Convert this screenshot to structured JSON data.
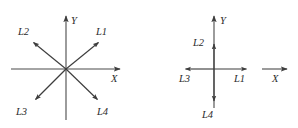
{
  "figure": {
    "title": "",
    "background_color": "#ffffff",
    "line_color": "#4a4a4a",
    "text_color": "#2b2b2b",
    "panels": [
      {
        "name": "left-panel",
        "description": "Four rays L1-L4 radiating diagonally from the origin of an X-Y coordinate system",
        "origin": {
          "x": 66,
          "y": 69
        },
        "axes": [
          {
            "name": "x-axis",
            "label": "X",
            "label_x": 113,
            "label_y": 81,
            "from": {
              "x": 11,
              "y": 69
            },
            "to": {
              "x": 122,
              "y": 69
            },
            "arrow": true
          },
          {
            "name": "y-axis",
            "label": "Y",
            "label_x": 72,
            "label_y": 23,
            "from": {
              "x": 66,
              "y": 120
            },
            "to": {
              "x": 66,
              "y": 14
            },
            "arrow": true
          }
        ],
        "rays": [
          {
            "name": "L1",
            "label": "L1",
            "label_x": 97,
            "label_y": 35,
            "to": {
              "x": 100,
              "y": 41
            },
            "angle_deg": 39
          },
          {
            "name": "L2",
            "label": "L2",
            "label_x": 18,
            "label_y": 35,
            "to": {
              "x": 32,
              "y": 41
            },
            "angle_deg": 141
          },
          {
            "name": "L3",
            "label": "L3",
            "label_x": 17,
            "label_y": 114,
            "to": {
              "x": 34,
              "y": 101
            },
            "angle_deg": 221
          },
          {
            "name": "L4",
            "label": "L4",
            "label_x": 97,
            "label_y": 114,
            "to": {
              "x": 99,
              "y": 101
            },
            "angle_deg": 319
          }
        ]
      },
      {
        "name": "right-panel",
        "description": "Four rays L1-L4 collapsed onto the X and Y axes of a coordinate system",
        "origin": {
          "x": 214,
          "y": 69
        },
        "axes": [
          {
            "name": "x-axis",
            "label": "X",
            "label_x": 273,
            "label_y": 81,
            "from": {
              "x": 262,
              "y": 69
            },
            "to": {
              "x": 289,
              "y": 69
            },
            "arrow": true
          },
          {
            "name": "y-axis",
            "label": "Y",
            "label_x": 221,
            "label_y": 23,
            "from": {
              "x": 214,
              "y": 108
            },
            "to": {
              "x": 214,
              "y": 14
            },
            "arrow": true
          }
        ],
        "rays": [
          {
            "name": "L1",
            "label": "L1",
            "label_x": 235,
            "label_y": 81,
            "to": {
              "x": 248,
              "y": 69
            },
            "direction": "right"
          },
          {
            "name": "L2",
            "label": "L2",
            "label_x": 194,
            "label_y": 45,
            "to": {
              "x": 214,
              "y": 42
            },
            "direction": "up"
          },
          {
            "name": "L3",
            "label": "L3",
            "label_x": 180,
            "label_y": 81,
            "to": {
              "x": 184,
              "y": 69
            },
            "direction": "left"
          },
          {
            "name": "L4",
            "label": "L4",
            "label_x": 203,
            "label_y": 117,
            "to": {
              "x": 214,
              "y": 103
            },
            "direction": "down"
          }
        ]
      }
    ]
  }
}
